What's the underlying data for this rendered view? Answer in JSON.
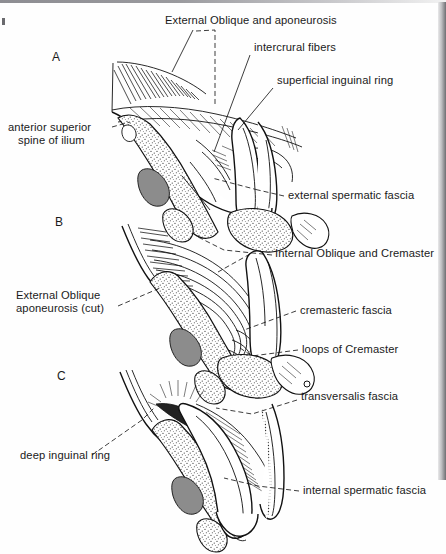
{
  "figure": {
    "type": "anatomical-line-illustration",
    "background_color": "#fefefe",
    "ink_color": "#1a1a1a"
  },
  "panels": [
    {
      "id": "A",
      "letter": "A",
      "x": 52,
      "y": 61
    },
    {
      "id": "B",
      "letter": "B",
      "x": 55,
      "y": 226
    },
    {
      "id": "C",
      "letter": "C",
      "x": 57,
      "y": 380
    }
  ],
  "labels": [
    {
      "id": "external-oblique-and-aponeurosis",
      "text": "External Oblique and aponeurosis",
      "x": 165,
      "y": 24,
      "anchor": "start",
      "panel": "A"
    },
    {
      "id": "intercrural-fibers",
      "text": "intercrural fibers",
      "x": 254,
      "y": 51,
      "anchor": "start",
      "panel": "A"
    },
    {
      "id": "superficial-inguinal-ring",
      "text": "superficial inguinal ring",
      "x": 277,
      "y": 84,
      "anchor": "start",
      "panel": "A"
    },
    {
      "id": "anterior-superior-spine-of-ilium-line1",
      "text": "anterior superior",
      "x": 8,
      "y": 131,
      "anchor": "start",
      "panel": "A"
    },
    {
      "id": "anterior-superior-spine-of-ilium-line2",
      "text": "spine of ilium",
      "x": 18,
      "y": 144,
      "anchor": "start",
      "panel": "A"
    },
    {
      "id": "external-spermatic-fascia",
      "text": "external spermatic fascia",
      "x": 288,
      "y": 199,
      "anchor": "start",
      "panel": "A"
    },
    {
      "id": "internal-oblique-and-cremaster",
      "text": "Internal Oblique and Cremaster",
      "x": 275,
      "y": 257,
      "anchor": "start",
      "panel": "B"
    },
    {
      "id": "external-oblique-aponeurosis-cut-line1",
      "text": "External Oblique",
      "x": 16,
      "y": 299,
      "anchor": "start",
      "panel": "B"
    },
    {
      "id": "external-oblique-aponeurosis-cut-line2",
      "text": "aponeurosis (cut)",
      "x": 16,
      "y": 312,
      "anchor": "start",
      "panel": "B"
    },
    {
      "id": "cremasteric-fascia",
      "text": "cremasteric fascia",
      "x": 300,
      "y": 314,
      "anchor": "start",
      "panel": "B"
    },
    {
      "id": "loops-of-cremaster",
      "text": "loops of Cremaster",
      "x": 302,
      "y": 353,
      "anchor": "start",
      "panel": "B"
    },
    {
      "id": "transversalis-fascia",
      "text": "transversalis fascia",
      "x": 301,
      "y": 400,
      "anchor": "start",
      "panel": "C"
    },
    {
      "id": "deep-inguinal-ring",
      "text": "deep inguinal ring",
      "x": 20,
      "y": 459,
      "anchor": "start",
      "panel": "C"
    },
    {
      "id": "internal-spermatic-fascia",
      "text": "internal spermatic fascia",
      "x": 303,
      "y": 494,
      "anchor": "start",
      "panel": "C"
    }
  ]
}
